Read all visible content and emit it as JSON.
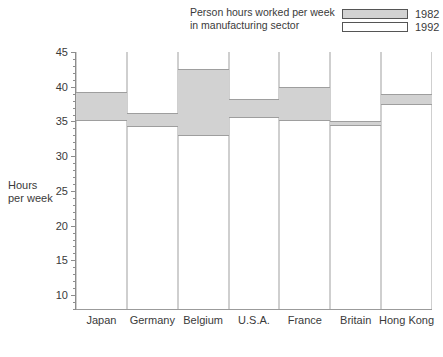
{
  "chart_data": {
    "type": "bar",
    "title": "Person hours worked per week in manufacturing sector",
    "xlabel": "",
    "ylabel": "Hours per week",
    "ylim": [
      8,
      45
    ],
    "ytick_values": [
      10,
      15,
      20,
      25,
      30,
      35,
      40,
      45
    ],
    "ytick_labels": [
      "10",
      "15",
      "20",
      "25",
      "30",
      "35",
      "40",
      "45"
    ],
    "minor_tick_step": 1,
    "grid": false,
    "legend_position": "top-right",
    "categories": [
      "Japan",
      "Germany",
      "Belgium",
      "U.S.A.",
      "France",
      "Britain",
      "Hong Kong"
    ],
    "series": [
      {
        "name": "1982",
        "color": "#d2d2d2",
        "values": [
          39.3,
          36.2,
          42.5,
          38.3,
          40.0,
          35.0,
          39.0
        ]
      },
      {
        "name": "1992",
        "color": "#ffffff",
        "values": [
          35.1,
          34.2,
          32.9,
          35.5,
          35.1,
          34.4,
          37.3
        ]
      }
    ]
  },
  "legend": {
    "caption_line1": "Person hours worked per week",
    "caption_line2": "in manufacturing sector",
    "entries": [
      {
        "label": "1982",
        "swatch": "gray-filled"
      },
      {
        "label": "1992",
        "swatch": "white-outline"
      }
    ]
  },
  "axis": {
    "y_title_line1": "Hours",
    "y_title_line2": "per week"
  },
  "colors": {
    "band_fill": "#d2d2d2",
    "band_border": "#9e9e9e",
    "bar_border": "#cfcfcf",
    "axis": "#8d8d8d",
    "text": "#3a3a3a"
  }
}
